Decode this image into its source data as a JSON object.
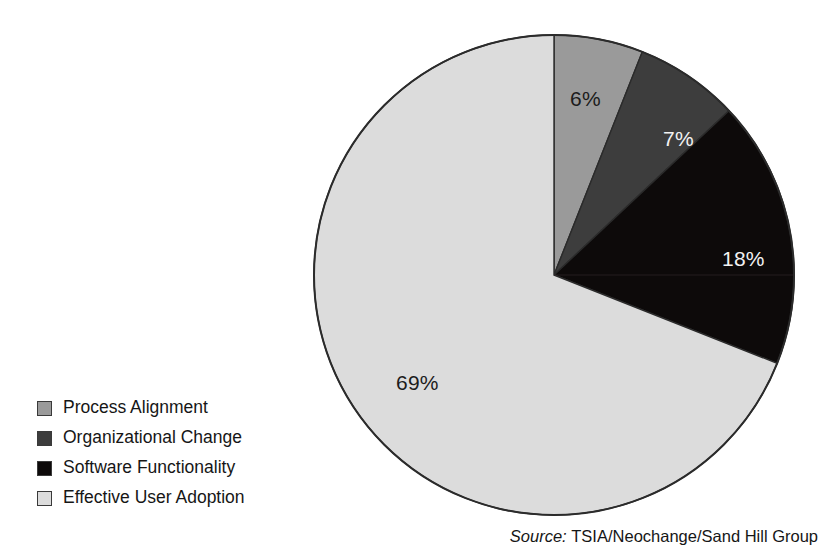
{
  "chart_data": {
    "type": "pie",
    "title": "",
    "categories": [
      "Process Alignment",
      "Organizational Change",
      "Software Functionality",
      "Effective User Adoption"
    ],
    "values": [
      6,
      7,
      18,
      69
    ],
    "value_labels": [
      "6%",
      "7%",
      "18%",
      "69%"
    ],
    "unit": "percent",
    "start_angle_deg": 0,
    "direction": "clockwise",
    "legend_position": "bottom-left",
    "slice_colors": [
      "#9a9a9a",
      "#3d3d3d",
      "#0d0a0a",
      "#dcdcdc"
    ],
    "label_text_colors": [
      "#1c1c1c",
      "#f2f2f2",
      "#f2f2f2",
      "#1c1c1c"
    ],
    "outline_color": "#2b2b2b",
    "background": "#ffffff",
    "slices": [
      {
        "label": "Process Alignment",
        "value": 6,
        "value_label": "6%",
        "color": "#9a9a9a",
        "start_deg": 0.0,
        "end_deg": 21.6
      },
      {
        "label": "Organizational Change",
        "value": 7,
        "value_label": "7%",
        "color": "#3d3d3d",
        "start_deg": 21.6,
        "end_deg": 46.8
      },
      {
        "label": "Software Functionality",
        "value": 18,
        "value_label": "18%",
        "color": "#0d0a0a",
        "start_deg": 46.8,
        "end_deg": 111.6
      },
      {
        "label": "Effective User Adoption",
        "value": 69,
        "value_label": "69%",
        "color": "#dcdcdc",
        "start_deg": 111.6,
        "end_deg": 360.0
      }
    ]
  },
  "legend": {
    "items": [
      {
        "label": "Process Alignment",
        "color": "#9a9a9a"
      },
      {
        "label": "Organizational Change",
        "color": "#3d3d3d"
      },
      {
        "label": "Software Functionality",
        "color": "#0d0a0a"
      },
      {
        "label": "Effective User Adoption",
        "color": "#dcdcdc"
      }
    ]
  },
  "source": {
    "label": "Source:",
    "text": "TSIA/Neochange/Sand Hill Group"
  }
}
